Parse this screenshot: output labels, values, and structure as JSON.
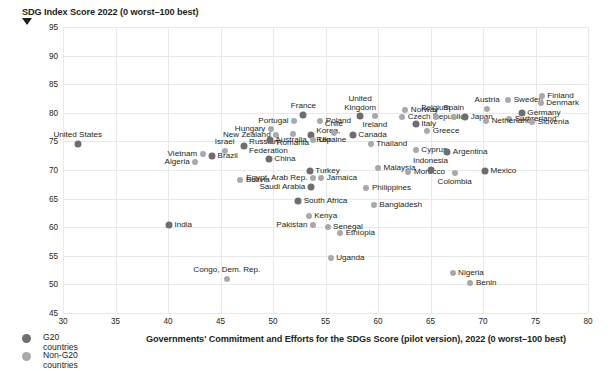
{
  "chart_data": {
    "type": "scatter",
    "title": "",
    "ylabel": "SDG Index Score 2022 (0 worst–100 best)",
    "xlabel": "Governments' Commitment and Efforts for the SDGs Score (pilot version), 2022 (0 worst–100 best)",
    "xlim": [
      30,
      80
    ],
    "ylim": [
      45,
      95
    ],
    "xticks": [
      30,
      35,
      40,
      45,
      50,
      55,
      60,
      65,
      70,
      75,
      80
    ],
    "yticks": [
      45,
      50,
      55,
      60,
      65,
      70,
      75,
      80,
      85,
      90,
      95
    ],
    "grid": true,
    "legend_position": "bottom-left",
    "colors": {
      "g20": "#6e6e71",
      "non_g20": "#a9a9ad",
      "grid": "#e9e9ea",
      "text": "#231f20"
    },
    "series": [
      {
        "name": "G20 countries",
        "group": "g20"
      },
      {
        "name": "Non-G20 countries",
        "group": "non_g20"
      }
    ],
    "points": [
      {
        "label": "United States",
        "x": 31.4,
        "y": 74.5,
        "group": "g20",
        "pos": "top"
      },
      {
        "label": "Vietnam",
        "x": 43.3,
        "y": 72.8,
        "group": "non_g20",
        "pos": "left"
      },
      {
        "label": "Algeria",
        "x": 42.6,
        "y": 71.4,
        "group": "non_g20",
        "pos": "left"
      },
      {
        "label": "Brazil",
        "x": 44.2,
        "y": 72.4,
        "group": "g20",
        "pos": "right"
      },
      {
        "label": "Israel",
        "x": 45.4,
        "y": 73.4,
        "group": "non_g20",
        "pos": "top"
      },
      {
        "label": "Russian Federation",
        "x": 47.2,
        "y": 74.2,
        "group": "g20",
        "pos": "right2"
      },
      {
        "label": "Bolivia",
        "x": 46.9,
        "y": 68.2,
        "group": "non_g20",
        "pos": "right"
      },
      {
        "label": "India",
        "x": 40.1,
        "y": 60.3,
        "group": "g20",
        "pos": "right"
      },
      {
        "label": "Hungary",
        "x": 49.8,
        "y": 77.1,
        "group": "non_g20",
        "pos": "left"
      },
      {
        "label": "New Zealand",
        "x": 50.3,
        "y": 76.2,
        "group": "non_g20",
        "pos": "left"
      },
      {
        "label": "Australia",
        "x": 49.7,
        "y": 75.3,
        "group": "g20",
        "pos": "right"
      },
      {
        "label": "Portugal",
        "x": 52.0,
        "y": 78.6,
        "group": "non_g20",
        "pos": "left"
      },
      {
        "label": "France",
        "x": 52.9,
        "y": 79.7,
        "group": "g20",
        "pos": "top"
      },
      {
        "label": "Poland",
        "x": 54.5,
        "y": 78.6,
        "group": "non_g20",
        "pos": "right"
      },
      {
        "label": "Romania",
        "x": 51.9,
        "y": 76.3,
        "group": "non_g20",
        "pos": "bottom"
      },
      {
        "label": "Korea, Rep.",
        "x": 53.6,
        "y": 76.2,
        "group": "g20",
        "pos": "right2"
      },
      {
        "label": "Chile",
        "x": 55.8,
        "y": 76.4,
        "group": "non_g20",
        "pos": "top"
      },
      {
        "label": "Ukraine",
        "x": 53.8,
        "y": 75.3,
        "group": "non_g20",
        "pos": "right"
      },
      {
        "label": "Canada",
        "x": 57.6,
        "y": 76.2,
        "group": "g20",
        "pos": "right"
      },
      {
        "label": "China",
        "x": 49.6,
        "y": 72.0,
        "group": "g20",
        "pos": "right"
      },
      {
        "label": "Turkey",
        "x": 53.5,
        "y": 69.8,
        "group": "g20",
        "pos": "right"
      },
      {
        "label": "Egypt, Arab Rep.",
        "x": 53.8,
        "y": 68.6,
        "group": "non_g20",
        "pos": "left"
      },
      {
        "label": "Jamaica",
        "x": 54.6,
        "y": 68.6,
        "group": "non_g20",
        "pos": "right"
      },
      {
        "label": "Saudi Arabia",
        "x": 53.6,
        "y": 67.0,
        "group": "g20",
        "pos": "left"
      },
      {
        "label": "South Africa",
        "x": 52.4,
        "y": 64.6,
        "group": "g20",
        "pos": "right"
      },
      {
        "label": "Kenya",
        "x": 53.4,
        "y": 62.0,
        "group": "non_g20",
        "pos": "right"
      },
      {
        "label": "Pakistan",
        "x": 53.8,
        "y": 60.4,
        "group": "non_g20",
        "pos": "left"
      },
      {
        "label": "Senegal",
        "x": 55.2,
        "y": 60.1,
        "group": "non_g20",
        "pos": "right"
      },
      {
        "label": "Ethiopia",
        "x": 56.4,
        "y": 59.0,
        "group": "non_g20",
        "pos": "right"
      },
      {
        "label": "Uganda",
        "x": 55.5,
        "y": 54.7,
        "group": "non_g20",
        "pos": "right"
      },
      {
        "label": "Congo, Dem. Rep.",
        "x": 45.6,
        "y": 50.9,
        "group": "non_g20",
        "pos": "top"
      },
      {
        "label": "United Kingdom",
        "x": 58.3,
        "y": 79.4,
        "group": "g20",
        "pos": "top2"
      },
      {
        "label": "Ireland",
        "x": 59.7,
        "y": 79.4,
        "group": "non_g20",
        "pos": "bottom"
      },
      {
        "label": "Norway",
        "x": 62.6,
        "y": 80.5,
        "group": "non_g20",
        "pos": "right"
      },
      {
        "label": "Czech Republic",
        "x": 62.3,
        "y": 79.3,
        "group": "non_g20",
        "pos": "right"
      },
      {
        "label": "Italy",
        "x": 63.6,
        "y": 78.0,
        "group": "g20",
        "pos": "right"
      },
      {
        "label": "Belgium",
        "x": 65.5,
        "y": 79.2,
        "group": "non_g20",
        "pos": "top"
      },
      {
        "label": "Spain",
        "x": 67.2,
        "y": 79.3,
        "group": "non_g20",
        "pos": "top"
      },
      {
        "label": "Japan",
        "x": 68.3,
        "y": 79.2,
        "group": "g20",
        "pos": "right"
      },
      {
        "label": "Greece",
        "x": 64.7,
        "y": 76.9,
        "group": "non_g20",
        "pos": "right"
      },
      {
        "label": "Austria",
        "x": 70.4,
        "y": 80.7,
        "group": "non_g20",
        "pos": "top"
      },
      {
        "label": "Sweden",
        "x": 72.4,
        "y": 82.2,
        "group": "non_g20",
        "pos": "right"
      },
      {
        "label": "Finland",
        "x": 75.6,
        "y": 82.9,
        "group": "non_g20",
        "pos": "right"
      },
      {
        "label": "Denmark",
        "x": 75.5,
        "y": 81.8,
        "group": "non_g20",
        "pos": "right"
      },
      {
        "label": "Germany",
        "x": 73.7,
        "y": 79.9,
        "group": "g20",
        "pos": "right"
      },
      {
        "label": "Switzerland",
        "x": 72.5,
        "y": 78.9,
        "group": "non_g20",
        "pos": "right"
      },
      {
        "label": "Netherlands",
        "x": 70.3,
        "y": 78.5,
        "group": "non_g20",
        "pos": "right"
      },
      {
        "label": "Slovenia",
        "x": 74.7,
        "y": 78.4,
        "group": "non_g20",
        "pos": "right"
      },
      {
        "label": "Thailand",
        "x": 59.3,
        "y": 74.6,
        "group": "non_g20",
        "pos": "right"
      },
      {
        "label": "Cyprus",
        "x": 63.6,
        "y": 73.5,
        "group": "non_g20",
        "pos": "right"
      },
      {
        "label": "Argentina",
        "x": 66.6,
        "y": 73.1,
        "group": "g20",
        "pos": "right"
      },
      {
        "label": "Malaysia",
        "x": 60.0,
        "y": 70.3,
        "group": "non_g20",
        "pos": "right"
      },
      {
        "label": "Morocco",
        "x": 62.9,
        "y": 69.6,
        "group": "non_g20",
        "pos": "right"
      },
      {
        "label": "Indonesia",
        "x": 65.0,
        "y": 70.0,
        "group": "g20",
        "pos": "top"
      },
      {
        "label": "Colombia",
        "x": 67.3,
        "y": 69.5,
        "group": "non_g20",
        "pos": "bottom"
      },
      {
        "label": "Mexico",
        "x": 70.2,
        "y": 69.9,
        "group": "g20",
        "pos": "right"
      },
      {
        "label": "Philippines",
        "x": 58.9,
        "y": 66.9,
        "group": "non_g20",
        "pos": "right"
      },
      {
        "label": "Bangladesh",
        "x": 59.6,
        "y": 63.9,
        "group": "non_g20",
        "pos": "right"
      },
      {
        "label": "Nigeria",
        "x": 67.1,
        "y": 52.0,
        "group": "non_g20",
        "pos": "right"
      },
      {
        "label": "Benin",
        "x": 68.8,
        "y": 50.2,
        "group": "non_g20",
        "pos": "right"
      }
    ]
  },
  "legend": {
    "items": [
      {
        "label": "G20 countries",
        "group": "g20"
      },
      {
        "label": "Non-G20 countries",
        "group": "non_g20"
      }
    ]
  }
}
